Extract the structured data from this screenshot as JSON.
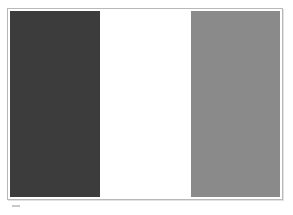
{
  "image": {
    "subject": "vertical tricolor flag (grayscale)",
    "bands": [
      {
        "name": "left",
        "color": "#3c3c3c"
      },
      {
        "name": "center",
        "color": "#ffffff"
      },
      {
        "name": "right",
        "color": "#8a8a8a"
      }
    ]
  }
}
